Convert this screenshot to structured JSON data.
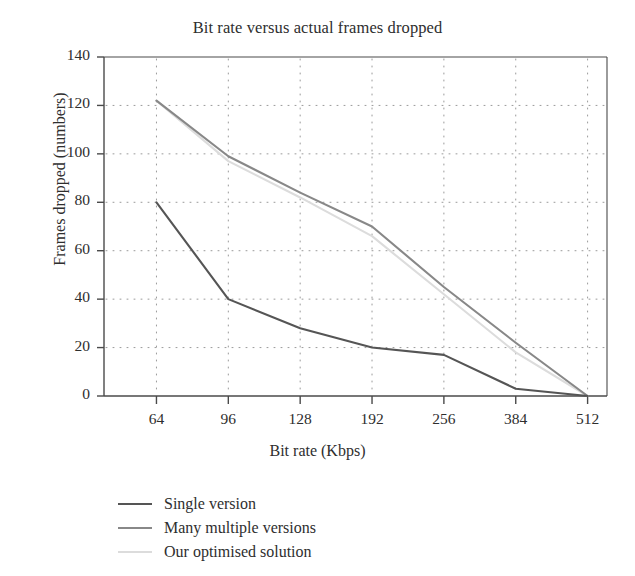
{
  "chart_data": {
    "type": "line",
    "title": "Bit rate versus actual frames dropped",
    "xlabel": "Bit rate (Kbps)",
    "ylabel": "Frames dropped (numbers)",
    "categories": [
      "64",
      "96",
      "128",
      "192",
      "256",
      "384",
      "512"
    ],
    "ylim": [
      0,
      140
    ],
    "yticks": [
      "0",
      "20",
      "40",
      "60",
      "80",
      "100",
      "120",
      "140"
    ],
    "grid": true,
    "grid_style": "dotted",
    "legend_position": "below-plot-left",
    "series": [
      {
        "name": "Single version",
        "color": "#555555",
        "values": [
          80,
          40,
          28,
          20,
          17,
          3,
          0
        ]
      },
      {
        "name": "Many multiple versions",
        "color": "#888888",
        "values": [
          122,
          99,
          84,
          70,
          45,
          22,
          0
        ]
      },
      {
        "name": "Our optimised solution",
        "color": "#dcdcdc",
        "values": [
          122,
          97,
          82,
          66,
          42,
          18,
          0
        ]
      }
    ]
  },
  "legend": {
    "items": [
      {
        "label": "Single version"
      },
      {
        "label": "Many multiple versions"
      },
      {
        "label": "Our optimised solution"
      }
    ]
  },
  "axes": {
    "axis_color": "#4a4a4a",
    "grid_color": "#9a9a9a"
  }
}
